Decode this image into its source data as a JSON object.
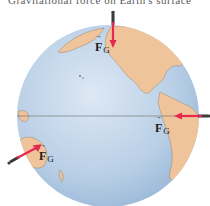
{
  "figure": {
    "caption_cut_text": "Gravitational force on Earth's surface",
    "colors": {
      "ocean": "#b9cfe6",
      "ocean_shade": "#8fb0d2",
      "land": "#efc49a",
      "arrow": "#e5284f",
      "arrow_tail": "#444444",
      "equator": "#6b6b6b",
      "background": "#ffffff"
    },
    "labels": [
      {
        "id": "fg-north",
        "symbol": "F",
        "subscript": "G"
      },
      {
        "id": "fg-east",
        "symbol": "F",
        "subscript": "G"
      },
      {
        "id": "fg-southwest",
        "symbol": "F",
        "subscript": "G"
      }
    ],
    "people_count": 3
  }
}
